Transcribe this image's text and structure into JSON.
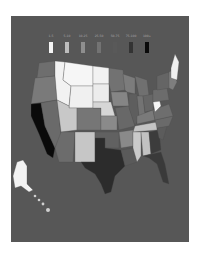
{
  "legend": {
    "items": [
      {
        "label": "1-5",
        "color": "#f4f4f4"
      },
      {
        "label": "5-10",
        "color": "#bdbdbd"
      },
      {
        "label": "10-25",
        "color": "#8e8e8e"
      },
      {
        "label": "25-50",
        "color": "#737373"
      },
      {
        "label": "50-75",
        "color": "#595959"
      },
      {
        "label": "75-100",
        "color": "#333333"
      },
      {
        "label": "100+",
        "color": "#0a0a0a"
      }
    ]
  },
  "map": {
    "background": "#575757",
    "regions": [
      {
        "name": "washington",
        "color": "#6e6e6e"
      },
      {
        "name": "oregon",
        "color": "#7a7a7a"
      },
      {
        "name": "california",
        "color": "#0a0a0a"
      },
      {
        "name": "nevada",
        "color": "#6a6a6a"
      },
      {
        "name": "idaho",
        "color": "#f2f2f2"
      },
      {
        "name": "montana",
        "color": "#f6f6f6"
      },
      {
        "name": "wyoming",
        "color": "#f0f0f0"
      },
      {
        "name": "utah",
        "color": "#c8c8c8"
      },
      {
        "name": "arizona",
        "color": "#6c6c6c"
      },
      {
        "name": "colorado",
        "color": "#767676"
      },
      {
        "name": "new-mexico",
        "color": "#c6c6c6"
      },
      {
        "name": "north-dakota",
        "color": "#f2f2f2"
      },
      {
        "name": "south-dakota",
        "color": "#ececec"
      },
      {
        "name": "nebraska",
        "color": "#d6d6d6"
      },
      {
        "name": "kansas",
        "color": "#8a8a8a"
      },
      {
        "name": "oklahoma",
        "color": "#616161"
      },
      {
        "name": "texas",
        "color": "#2c2c2c"
      },
      {
        "name": "minnesota",
        "color": "#727272"
      },
      {
        "name": "iowa",
        "color": "#858585"
      },
      {
        "name": "missouri",
        "color": "#686868"
      },
      {
        "name": "arkansas",
        "color": "#8a8a8a"
      },
      {
        "name": "louisiana",
        "color": "#5a5a5a"
      },
      {
        "name": "wisconsin",
        "color": "#7c7c7c"
      },
      {
        "name": "illinois",
        "color": "#5e5e5e"
      },
      {
        "name": "michigan",
        "color": "#707070"
      },
      {
        "name": "indiana",
        "color": "#737373"
      },
      {
        "name": "ohio",
        "color": "#666666"
      },
      {
        "name": "kentucky",
        "color": "#7a7a7a"
      },
      {
        "name": "tennessee",
        "color": "#c4c4c4"
      },
      {
        "name": "mississippi",
        "color": "#cacaca"
      },
      {
        "name": "alabama",
        "color": "#c2c2c2"
      },
      {
        "name": "georgia",
        "color": "#3c3c3c"
      },
      {
        "name": "florida",
        "color": "#3a3a3a"
      },
      {
        "name": "south-carolina",
        "color": "#5c5c5c"
      },
      {
        "name": "north-carolina",
        "color": "#6a6a6a"
      },
      {
        "name": "virginia",
        "color": "#6e6e6e"
      },
      {
        "name": "west-virginia",
        "color": "#f6f6f6"
      },
      {
        "name": "pennsylvania",
        "color": "#6c6c6c"
      },
      {
        "name": "new-york",
        "color": "#656565"
      },
      {
        "name": "maine",
        "color": "#f0f0f0"
      },
      {
        "name": "new-england",
        "color": "#7e7e7e"
      },
      {
        "name": "alaska",
        "color": "#f2f2f2"
      },
      {
        "name": "hawaii",
        "color": "#d0d0d0"
      }
    ]
  }
}
